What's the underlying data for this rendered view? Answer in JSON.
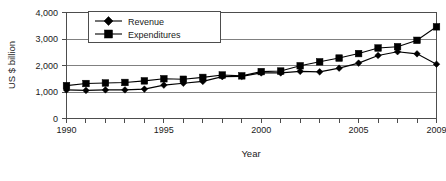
{
  "chart_data": {
    "type": "line",
    "title": "",
    "xlabel": "Year",
    "ylabel": "US $ billion",
    "x": [
      1990,
      1991,
      1992,
      1993,
      1994,
      1995,
      1996,
      1997,
      1998,
      1999,
      2000,
      2001,
      2002,
      2003,
      2004,
      2005,
      2006,
      2007,
      2008,
      2009
    ],
    "xlim": [
      1990,
      2009
    ],
    "ylim": [
      0,
      4000
    ],
    "yticks": [
      0,
      1000,
      2000,
      3000,
      4000
    ],
    "ytick_labels": [
      "0",
      "1,000",
      "2,000",
      "3,000",
      "4,000"
    ],
    "xticks": [
      1990,
      1995,
      2000,
      2005,
      2009
    ],
    "xtick_labels": [
      "1990",
      "1995",
      "2000",
      "2005",
      "2009"
    ],
    "grid": true,
    "grid_axis": "y",
    "legend_position": "top-left",
    "series": [
      {
        "name": "Revenue",
        "marker": "diamond",
        "values": [
          1080,
          1060,
          1080,
          1080,
          1110,
          1260,
          1330,
          1400,
          1580,
          1590,
          1720,
          1720,
          1780,
          1760,
          1900,
          2090,
          2380,
          2520,
          2440,
          2050
        ]
      },
      {
        "name": "Expenditures",
        "marker": "square",
        "values": [
          1240,
          1320,
          1340,
          1360,
          1420,
          1500,
          1480,
          1550,
          1640,
          1610,
          1770,
          1790,
          1990,
          2140,
          2280,
          2450,
          2660,
          2710,
          2950,
          3460
        ]
      }
    ]
  },
  "legend": {
    "entries": [
      {
        "label": "Revenue",
        "marker": "diamond-marker"
      },
      {
        "label": "Expenditures",
        "marker": "square-marker"
      }
    ]
  },
  "axes": {
    "y_title": "US $ billion",
    "x_title": "Year"
  }
}
